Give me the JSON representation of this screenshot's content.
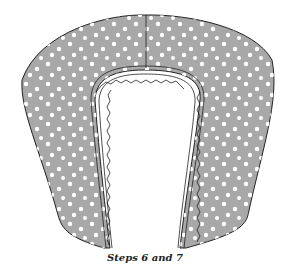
{
  "caption": "Steps 6 and 7",
  "colors": {
    "fabric": "#a8a8a8",
    "dots": "#ffffff",
    "outline": "#222222",
    "background": "#ffffff"
  }
}
